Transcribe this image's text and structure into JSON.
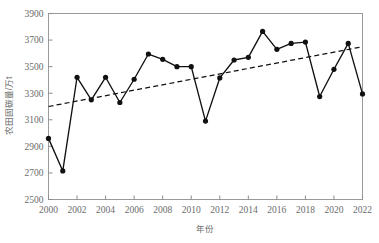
{
  "chart_data": {
    "type": "line",
    "title": "",
    "xlabel": "年份",
    "ylabel": "农田固碳量/万t",
    "xlim": [
      2000,
      2022
    ],
    "ylim": [
      2500,
      3900
    ],
    "grid": false,
    "legend": "none",
    "x_tick_labels": [
      "2000",
      "2002",
      "2004",
      "2006",
      "2008",
      "2010",
      "2012",
      "2014",
      "2016",
      "2018",
      "2020",
      "2022"
    ],
    "x_tick_values": [
      2000,
      2002,
      2004,
      2006,
      2008,
      2010,
      2012,
      2014,
      2016,
      2018,
      2020,
      2022
    ],
    "y_tick_labels": [
      "2500",
      "2700",
      "2900",
      "3100",
      "3300",
      "3500",
      "3700",
      "3900"
    ],
    "y_tick_values": [
      2500,
      2700,
      2900,
      3100,
      3300,
      3500,
      3700,
      3900
    ],
    "x": [
      2000,
      2001,
      2002,
      2003,
      2004,
      2005,
      2006,
      2007,
      2008,
      2009,
      2010,
      2011,
      2012,
      2013,
      2014,
      2015,
      2016,
      2017,
      2018,
      2019,
      2020,
      2021,
      2022
    ],
    "series": [
      {
        "name": "农田固碳量",
        "style": "solid-line-with-markers",
        "color": "#111111",
        "values": [
          2960,
          2715,
          3420,
          3250,
          3420,
          3230,
          3405,
          3595,
          3555,
          3500,
          3500,
          3090,
          3415,
          3550,
          3570,
          3765,
          3630,
          3675,
          3685,
          3275,
          3480,
          3675,
          3295
        ]
      },
      {
        "name": "趋势线",
        "style": "dashed-trend-line",
        "color": "#111111",
        "endpoints": [
          {
            "x": 2000,
            "y": 3200
          },
          {
            "x": 2022,
            "y": 3650
          }
        ]
      }
    ]
  },
  "axes": {
    "y_axis_title": "农田固碳量/万t",
    "x_axis_title": "年份"
  }
}
